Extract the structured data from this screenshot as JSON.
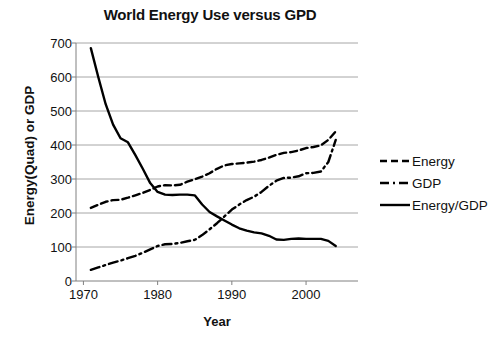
{
  "chart_data": {
    "type": "line",
    "title": "World Energy Use versus GPD",
    "xlabel": "Year",
    "ylabel": "Energy(Quad) or GDP",
    "xlim": [
      1969,
      2007
    ],
    "ylim": [
      0,
      700
    ],
    "xticks": [
      1970,
      1980,
      1990,
      2000
    ],
    "yticks": [
      0,
      100,
      200,
      300,
      400,
      500,
      600,
      700
    ],
    "grid": true,
    "legend_position": "right",
    "x": [
      1971,
      1972,
      1973,
      1974,
      1975,
      1976,
      1977,
      1978,
      1979,
      1980,
      1981,
      1982,
      1983,
      1984,
      1985,
      1986,
      1987,
      1988,
      1989,
      1990,
      1991,
      1992,
      1993,
      1994,
      1995,
      1996,
      1997,
      1998,
      1999,
      2000,
      2001,
      2002,
      2003,
      2004
    ],
    "series": [
      {
        "name": "Energy",
        "style": "dashed",
        "color": "#000000",
        "values": [
          215,
          224,
          233,
          238,
          239,
          245,
          252,
          259,
          268,
          278,
          282,
          281,
          283,
          292,
          299,
          307,
          317,
          330,
          340,
          344,
          346,
          348,
          351,
          356,
          363,
          371,
          377,
          379,
          384,
          391,
          394,
          399,
          415,
          440
        ]
      },
      {
        "name": "GDP",
        "style": "dash-dot",
        "color": "#000000",
        "values": [
          33,
          40,
          47,
          54,
          60,
          67,
          74,
          83,
          93,
          103,
          108,
          109,
          112,
          117,
          121,
          135,
          152,
          170,
          190,
          210,
          225,
          238,
          248,
          262,
          280,
          295,
          303,
          304,
          308,
          317,
          318,
          322,
          350,
          415
        ]
      },
      {
        "name": "Energy/GDP",
        "style": "solid",
        "color": "#000000",
        "values": [
          685,
          600,
          520,
          460,
          420,
          408,
          370,
          330,
          288,
          262,
          254,
          253,
          254,
          254,
          252,
          225,
          203,
          190,
          178,
          166,
          155,
          148,
          143,
          140,
          133,
          122,
          121,
          124,
          125,
          124,
          124,
          124,
          118,
          103
        ]
      }
    ]
  },
  "legend": {
    "items": [
      {
        "label": "Energy",
        "style": "dashed"
      },
      {
        "label": "GDP",
        "style": "dash-dot"
      },
      {
        "label": "Energy/GDP",
        "style": "solid"
      }
    ]
  }
}
